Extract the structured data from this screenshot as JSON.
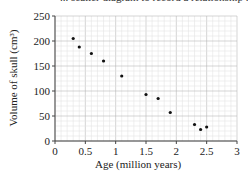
{
  "header": {
    "clipped_text": "... scatter diagram to record a relationship ..."
  },
  "chart_data": {
    "type": "scatter",
    "title": "",
    "xlabel": "Age (million years)",
    "ylabel": "Volume of skull (cm³)",
    "xlim": [
      0,
      3
    ],
    "ylim": [
      0,
      250
    ],
    "x_ticks": [
      "0",
      "0.5",
      "1",
      "1.5",
      "2",
      "2.5",
      "3"
    ],
    "y_ticks": [
      "0",
      "50",
      "100",
      "150",
      "200",
      "250"
    ],
    "grid": true,
    "series": [
      {
        "name": "skull volume",
        "points": [
          {
            "x": 0.3,
            "y": 205
          },
          {
            "x": 0.4,
            "y": 188
          },
          {
            "x": 0.6,
            "y": 175
          },
          {
            "x": 0.8,
            "y": 160
          },
          {
            "x": 1.1,
            "y": 130
          },
          {
            "x": 1.5,
            "y": 93
          },
          {
            "x": 1.7,
            "y": 85
          },
          {
            "x": 1.9,
            "y": 57
          },
          {
            "x": 2.3,
            "y": 33
          },
          {
            "x": 2.4,
            "y": 23
          },
          {
            "x": 2.5,
            "y": 28
          }
        ]
      }
    ]
  },
  "colors": {
    "major_grid": "#b8b8b8",
    "minor_grid": "#e4e4e4",
    "axis": "#444444",
    "point": "#111111"
  }
}
